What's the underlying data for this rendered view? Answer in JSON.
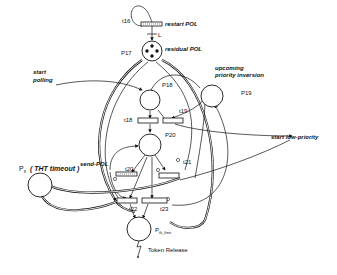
{
  "diagram": {
    "type": "petri-net",
    "places": [
      {
        "id": "P17",
        "label": "P17",
        "annotation": "residual POL",
        "tokens": 4
      },
      {
        "id": "P18",
        "label": "P18",
        "annotation": ""
      },
      {
        "id": "P19",
        "label": "P19",
        "annotation": "upcoming priority inversion"
      },
      {
        "id": "P20",
        "label": "P20",
        "annotation": ""
      },
      {
        "id": "P8",
        "label": "P8",
        "annotation": "( THT timeout )"
      },
      {
        "id": "Ptk_free",
        "label": "Ptk_free",
        "annotation": "Token Release"
      }
    ],
    "transitions": [
      {
        "id": "t16",
        "label": "t16",
        "annotation": "restart POL"
      },
      {
        "id": "t18",
        "label": "t18"
      },
      {
        "id": "t19",
        "label": "t19"
      },
      {
        "id": "t20",
        "label": "t20",
        "annotation": "send-POL"
      },
      {
        "id": "t21",
        "label": "t21"
      },
      {
        "id": "t22",
        "label": "t22"
      },
      {
        "id": "t23",
        "label": "t23"
      }
    ],
    "annotations": {
      "start_polling_1": "start",
      "start_polling_2": "polling",
      "upcoming_1": "upcoming",
      "upcoming_2": "priority inversion",
      "start_low_priority": "start low-priority",
      "restart_pol": "restart POL",
      "residual_pol": "residual POL",
      "arc_weight_L": "L",
      "send_pol": "send-POL",
      "tht_timeout": "( THT timeout )",
      "token_release": "Token Release"
    },
    "labels": {
      "t16": "t16",
      "t18": "t18",
      "t19": "t19",
      "t20": "t20",
      "t21": "t21",
      "t22": "t22",
      "t23": "t23",
      "P17": "P17",
      "P18": "P18",
      "P19": "P19",
      "P20": "P20",
      "P8": "P",
      "P8_sub": "8",
      "Ptk": "P",
      "Ptk_sub": "tk_free"
    }
  }
}
